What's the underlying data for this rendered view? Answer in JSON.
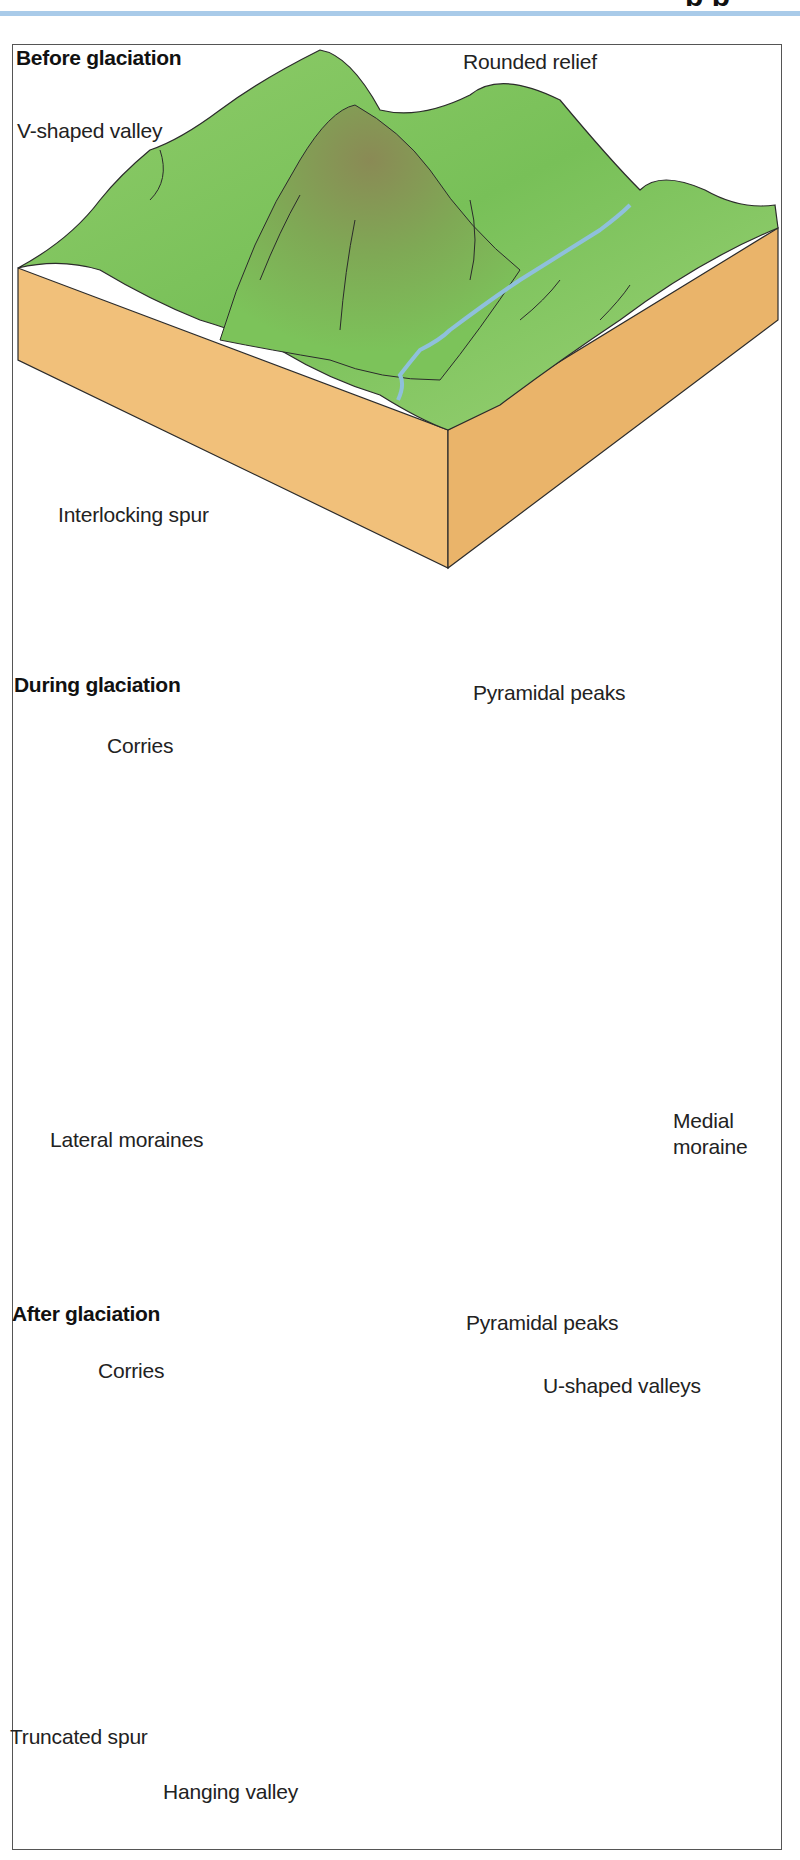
{
  "header": {
    "title_fragment": "p p",
    "rule_color": "#a9cbe9"
  },
  "colors": {
    "grass": "#7cc35a",
    "grass_light": "#a4d67e",
    "grass_dark": "#5da845",
    "soil": "#f1c07a",
    "soil_dark": "#e8ad5d",
    "rock": "#a89272",
    "rock_dark": "#7d6b52",
    "ice": "#eef5fa",
    "ice_shadow": "#b7ccdc",
    "river": "#8fc0dc",
    "outline": "#2b2b2b"
  },
  "panels": [
    {
      "title": "Before glaciation",
      "labels": {
        "v_shaped_valley": "V-shaped valley",
        "rounded_relief": "Rounded relief",
        "interlocking_spur": "Interlocking spur"
      }
    },
    {
      "title": "During glaciation",
      "labels": {
        "pyramidal_peaks": "Pyramidal peaks",
        "corries": "Corries",
        "lateral_moraines": "Lateral moraines",
        "medial_moraine": "Medial moraine"
      }
    },
    {
      "title": "After glaciation",
      "labels": {
        "pyramidal_peaks": "Pyramidal peaks",
        "corries": "Corries",
        "u_shaped_valleys": "U-shaped valleys",
        "truncated_spur": "Truncated spur",
        "hanging_valley": "Hanging valley"
      }
    }
  ]
}
